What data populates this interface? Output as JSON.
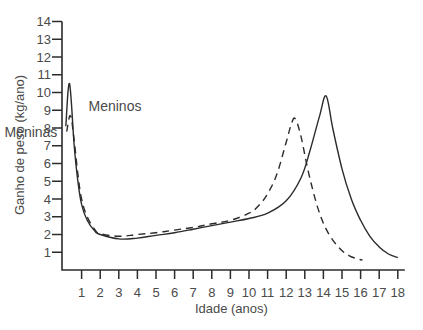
{
  "chart_data": {
    "type": "line",
    "title": "",
    "xlabel": "Idade (anos)",
    "ylabel": "Ganho de peso (kg/ano)",
    "xlim": [
      0,
      18
    ],
    "ylim": [
      0,
      14
    ],
    "xticks": [
      1,
      2,
      3,
      4,
      5,
      6,
      7,
      8,
      9,
      10,
      11,
      12,
      13,
      14,
      15,
      16,
      17,
      18
    ],
    "yticks": [
      1,
      2,
      3,
      4,
      5,
      6,
      7,
      8,
      9,
      10,
      11,
      12,
      13,
      14
    ],
    "grid": false,
    "legend": "inline-labels",
    "series": [
      {
        "name": "Meninos",
        "style": "solid",
        "color": "#2b2b2b",
        "label_anchor": "right-of-peak",
        "points": [
          [
            0.15,
            8.1
          ],
          [
            0.35,
            10.5
          ],
          [
            0.6,
            7.0
          ],
          [
            0.8,
            5.0
          ],
          [
            1.0,
            3.7
          ],
          [
            1.3,
            2.8
          ],
          [
            1.7,
            2.2
          ],
          [
            2.0,
            2.0
          ],
          [
            3.0,
            1.75
          ],
          [
            4.0,
            1.8
          ],
          [
            5.0,
            1.95
          ],
          [
            6.0,
            2.1
          ],
          [
            7.0,
            2.3
          ],
          [
            8.0,
            2.5
          ],
          [
            9.0,
            2.7
          ],
          [
            10.0,
            2.9
          ],
          [
            11.0,
            3.2
          ],
          [
            12.0,
            3.9
          ],
          [
            12.8,
            5.2
          ],
          [
            13.3,
            6.8
          ],
          [
            13.8,
            8.7
          ],
          [
            14.15,
            9.8
          ],
          [
            14.5,
            8.0
          ],
          [
            15.0,
            5.7
          ],
          [
            15.5,
            4.0
          ],
          [
            16.0,
            2.8
          ],
          [
            16.5,
            1.9
          ],
          [
            17.0,
            1.3
          ],
          [
            17.5,
            0.9
          ],
          [
            18.0,
            0.7
          ]
        ]
      },
      {
        "name": "Meninas",
        "style": "dashed",
        "color": "#2b2b2b",
        "label_anchor": "left-of-peak",
        "points": [
          [
            0.2,
            7.8
          ],
          [
            0.4,
            8.7
          ],
          [
            0.6,
            7.3
          ],
          [
            0.8,
            5.4
          ],
          [
            1.0,
            4.0
          ],
          [
            1.3,
            3.0
          ],
          [
            1.7,
            2.3
          ],
          [
            2.0,
            2.05
          ],
          [
            3.0,
            1.9
          ],
          [
            4.0,
            2.0
          ],
          [
            5.0,
            2.1
          ],
          [
            6.0,
            2.25
          ],
          [
            7.0,
            2.4
          ],
          [
            8.0,
            2.6
          ],
          [
            9.0,
            2.8
          ],
          [
            10.0,
            3.2
          ],
          [
            10.5,
            3.6
          ],
          [
            11.0,
            4.3
          ],
          [
            11.5,
            5.4
          ],
          [
            12.0,
            7.2
          ],
          [
            12.3,
            8.3
          ],
          [
            12.5,
            8.5
          ],
          [
            12.8,
            7.5
          ],
          [
            13.2,
            5.5
          ],
          [
            13.7,
            3.5
          ],
          [
            14.2,
            2.2
          ],
          [
            14.8,
            1.3
          ],
          [
            15.4,
            0.8
          ],
          [
            16.1,
            0.55
          ]
        ]
      }
    ],
    "annotations": [
      {
        "text": "Meninas",
        "series": "Meninas"
      },
      {
        "text": "Meninos",
        "series": "Meninos"
      }
    ]
  }
}
